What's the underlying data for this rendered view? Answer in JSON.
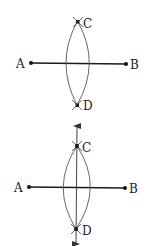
{
  "figures": [
    {
      "name": "step-1-arcs",
      "points": {
        "A": {
          "label": "A"
        },
        "B": {
          "label": "B"
        },
        "C": {
          "label": "C"
        },
        "D": {
          "label": "D"
        }
      }
    },
    {
      "name": "step-2-perpendicular-bisector",
      "points": {
        "A": {
          "label": "A"
        },
        "B": {
          "label": "B"
        },
        "C": {
          "label": "C"
        },
        "D": {
          "label": "D"
        }
      }
    }
  ],
  "colors": {
    "stroke": "#222222",
    "arc": "#555555"
  }
}
